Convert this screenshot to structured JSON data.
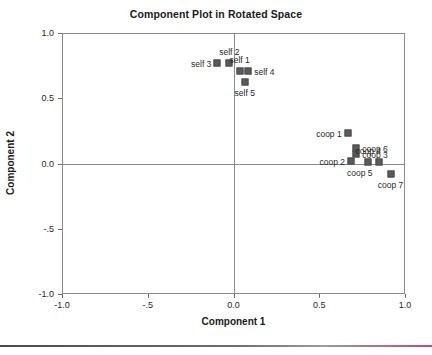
{
  "chart_data": {
    "type": "scatter",
    "title": "Component Plot in Rotated Space",
    "xlabel": "Component 1",
    "ylabel": "Component 2",
    "xlim": [
      -1.0,
      1.0
    ],
    "ylim": [
      -1.0,
      1.0
    ],
    "xticks": [
      -1.0,
      -0.5,
      0.0,
      0.5,
      1.0
    ],
    "yticks": [
      -1.0,
      -0.5,
      0.0,
      0.5,
      1.0
    ],
    "xticklabels": [
      "-1.0",
      "-.5",
      "0.0",
      "0.5",
      "1.0"
    ],
    "yticklabels": [
      "-1.0",
      "-.5",
      "0.0",
      "0.5",
      "1.0"
    ],
    "grid": false,
    "legend": null,
    "marker_color": "#5a5a5a",
    "axis_color": "#8a8a8a",
    "points": [
      {
        "label": "self 3",
        "x": -0.1,
        "y": 0.78,
        "label_pos": "left"
      },
      {
        "label": "self 2",
        "x": -0.03,
        "y": 0.78,
        "label_pos": "above"
      },
      {
        "label": "self 1",
        "x": 0.03,
        "y": 0.72,
        "label_pos": "above"
      },
      {
        "label": "self 4",
        "x": 0.08,
        "y": 0.72,
        "label_pos": "right"
      },
      {
        "label": "self 5",
        "x": 0.06,
        "y": 0.63,
        "label_pos": "below"
      },
      {
        "label": "coop 1",
        "x": 0.66,
        "y": 0.24,
        "label_pos": "left"
      },
      {
        "label": "coop 6",
        "x": 0.71,
        "y": 0.13,
        "label_pos": "right"
      },
      {
        "label": "coop 3",
        "x": 0.71,
        "y": 0.08,
        "label_pos": "right"
      },
      {
        "label": "coop 2",
        "x": 0.68,
        "y": 0.03,
        "label_pos": "left"
      },
      {
        "label": "coop 4",
        "x": 0.78,
        "y": 0.02,
        "label_pos": "above"
      },
      {
        "label": "coop 5",
        "x": 0.84,
        "y": 0.02,
        "label_pos": "belowleft"
      },
      {
        "label": "coop 7",
        "x": 0.91,
        "y": -0.07,
        "label_pos": "below"
      }
    ]
  }
}
